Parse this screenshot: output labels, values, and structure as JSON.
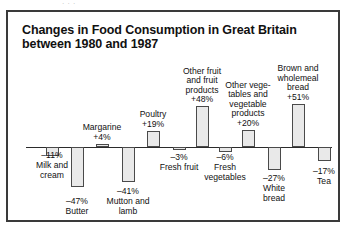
{
  "ghost_text": "· · ·",
  "frame": {
    "border_color": "#3a3a3a"
  },
  "chart_data": {
    "type": "bar",
    "title": "Changes in Food Consumption in Great Britain between 1980 and 1987",
    "title_line1": "Changes in Food Consumption in Great Britain",
    "title_line2": "between 1980 and 1987",
    "xlabel": "",
    "ylabel": "",
    "ylim": [
      -50,
      55
    ],
    "grid": false,
    "legend": "none",
    "baseline": 0,
    "bar_fill_color": "#e9e9e9",
    "bar_border_color": "#4a4a4a",
    "categories": [
      "Milk and cream",
      "Butter",
      "Margarine",
      "Mutton and lamb",
      "Poultry",
      "Fresh fruit",
      "Other fruit and fruit products",
      "Fresh vegetables",
      "Other vegetables and vegetable products",
      "White bread",
      "Brown and wholemeal bread",
      "Tea"
    ],
    "values": [
      -11,
      -47,
      4,
      -41,
      19,
      -3,
      48,
      -6,
      20,
      -27,
      51,
      -17
    ],
    "data_labels": [
      "–11%",
      "–47%",
      "+4%",
      "–41%",
      "+19%",
      "–3%",
      "+48%",
      "–6%",
      "+20%",
      "–27%",
      "+51%",
      "–17%"
    ],
    "points": [
      {
        "name": "milk-and-cream",
        "label": "Milk and\ncream",
        "value": -11,
        "data_label": "–11%",
        "label_pos": "below"
      },
      {
        "name": "butter",
        "label": "Butter",
        "value": -47,
        "data_label": "–47%",
        "label_pos": "below"
      },
      {
        "name": "margarine",
        "label": "Margarine",
        "value": 4,
        "data_label": "+4%",
        "label_pos": "above"
      },
      {
        "name": "mutton-and-lamb",
        "label": "Mutton and\nlamb",
        "value": -41,
        "data_label": "–41%",
        "label_pos": "below"
      },
      {
        "name": "poultry",
        "label": "Poultry",
        "value": 19,
        "data_label": "+19%",
        "label_pos": "above"
      },
      {
        "name": "fresh-fruit",
        "label": "Fresh fruit",
        "value": -3,
        "data_label": "–3%",
        "label_pos": "below"
      },
      {
        "name": "other-fruit-and-fruit-products",
        "label": "Other fruit\nand fruit\nproducts",
        "value": 48,
        "data_label": "+48%",
        "label_pos": "above"
      },
      {
        "name": "fresh-vegetables",
        "label": "Fresh\nvegetables",
        "value": -6,
        "data_label": "–6%",
        "label_pos": "below"
      },
      {
        "name": "other-vegetables-and-vegetable-products",
        "label": "Other vege-\ntables and\nvegetable\nproducts",
        "value": 20,
        "data_label": "+20%",
        "label_pos": "above"
      },
      {
        "name": "white-bread",
        "label": "White\nbread",
        "value": -27,
        "data_label": "–27%",
        "label_pos": "below"
      },
      {
        "name": "brown-and-wholemeal-bread",
        "label": "Brown and\nwholemeal\nbread",
        "value": 51,
        "data_label": "+51%",
        "label_pos": "above"
      },
      {
        "name": "tea",
        "label": "Tea",
        "value": -17,
        "data_label": "–17%",
        "label_pos": "below"
      }
    ]
  }
}
